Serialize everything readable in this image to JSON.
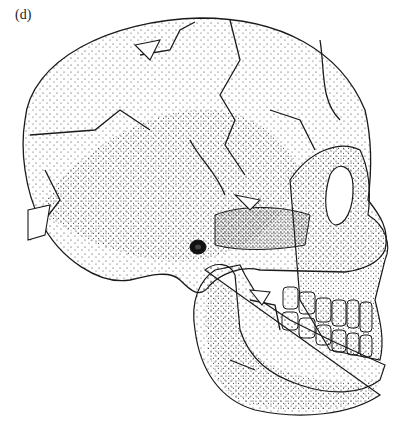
{
  "figure": {
    "panel_label": "(d)",
    "colors": {
      "ink": "#1a1a1a",
      "background": "#ffffff"
    }
  }
}
